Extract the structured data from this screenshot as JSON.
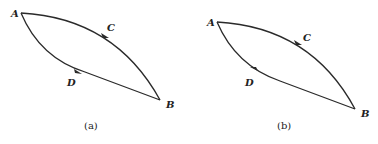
{
  "panels": [
    {
      "id": "a",
      "caption": "(a)",
      "points": {
        "A": "A",
        "B": "B",
        "C": "C",
        "D": "D"
      },
      "paths": [
        {
          "name": "ACB",
          "via": "C",
          "direction": "A-to-B"
        },
        {
          "name": "ADB",
          "via": "D",
          "direction": "A-to-B"
        }
      ]
    },
    {
      "id": "b",
      "caption": "(b)",
      "points": {
        "A": "A",
        "B": "B",
        "C": "C",
        "D": "D"
      },
      "paths": [
        {
          "name": "ACB",
          "via": "C",
          "direction": "A-to-B"
        },
        {
          "name": "BDA",
          "via": "D",
          "direction": "B-to-A"
        }
      ]
    }
  ]
}
